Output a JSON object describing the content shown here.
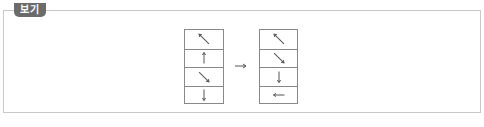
{
  "label": {
    "text": "보기"
  },
  "colors": {
    "badge_bg": "#6b6b6b",
    "border": "#c8c8c8",
    "grid_line": "#888888",
    "arrow": "#555555"
  },
  "diagram": {
    "before": {
      "cells": [
        {
          "direction": "up-left",
          "icon": "arrow-up-left-icon"
        },
        {
          "direction": "up",
          "icon": "arrow-up-icon"
        },
        {
          "direction": "down-right",
          "icon": "arrow-down-right-icon"
        },
        {
          "direction": "down",
          "icon": "arrow-down-icon"
        }
      ]
    },
    "transition": {
      "icon": "arrow-right-icon",
      "glyph": "→"
    },
    "after": {
      "cells": [
        {
          "direction": "up-left",
          "icon": "arrow-up-left-icon"
        },
        {
          "direction": "down-right",
          "icon": "arrow-down-right-icon"
        },
        {
          "direction": "down",
          "icon": "arrow-down-icon"
        },
        {
          "direction": "left",
          "icon": "arrow-left-icon"
        }
      ]
    }
  }
}
